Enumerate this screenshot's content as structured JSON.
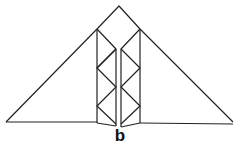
{
  "diagram": {
    "label": "b",
    "stroke_color": "#222222"
  }
}
